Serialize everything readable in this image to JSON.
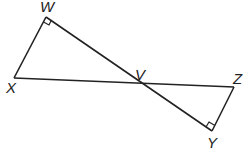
{
  "diagram": {
    "type": "geometry",
    "points": {
      "W": {
        "label": "W",
        "x": 46,
        "y": 17
      },
      "X": {
        "label": "X",
        "x": 14,
        "y": 78
      },
      "V": {
        "label": "V",
        "x": 139,
        "y": 84
      },
      "Z": {
        "label": "Z",
        "x": 234,
        "y": 87
      },
      "Y": {
        "label": "Y",
        "x": 212,
        "y": 131
      }
    },
    "segments": [
      "WX",
      "WY",
      "XZ",
      "ZY"
    ],
    "right_angles": [
      "W",
      "Y"
    ],
    "stroke_color": "#222222"
  }
}
